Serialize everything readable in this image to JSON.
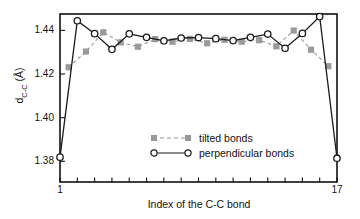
{
  "chart_data": {
    "type": "line",
    "title": "",
    "xlabel": "Index of the C-C bond",
    "ylabel_html": "d<sub>C-C</sub> (Å)",
    "ylabel_plain": "d_C-C (A)",
    "xlim": [
      1,
      17
    ],
    "ylim": [
      1.3705,
      1.4475
    ],
    "yticks": [
      1.38,
      1.4,
      1.42,
      1.44
    ],
    "ytick_labels": [
      "1.38",
      "1.40",
      "1.42",
      "1.44"
    ],
    "xticks": [
      1,
      2,
      3,
      4,
      5,
      6,
      7,
      8,
      9,
      10,
      11,
      12,
      13,
      14,
      15,
      16,
      17
    ],
    "xtick_labels_shown": [
      "1",
      "17"
    ],
    "grid": false,
    "legend_position": "center",
    "series": [
      {
        "name": "tilted bonds",
        "marker": "filled-square",
        "color": "#9a9a9a",
        "linestyle": "dashed",
        "x": [
          1.5,
          2.5,
          3.5,
          4.5,
          5.5,
          6.5,
          7.5,
          8.5,
          9.5,
          10.5,
          11.5,
          12.5,
          13.5,
          14.5,
          15.5,
          16.5
        ],
        "values": [
          1.4231,
          1.4303,
          1.4391,
          1.4345,
          1.4325,
          1.436,
          1.4348,
          1.4361,
          1.4341,
          1.4357,
          1.4348,
          1.4355,
          1.4327,
          1.4399,
          1.4311,
          1.4236
        ]
      },
      {
        "name": "perpendicular bonds",
        "marker": "open-circle",
        "color": "#1a1a1a",
        "linestyle": "solid",
        "x": [
          1,
          2,
          3,
          4,
          5,
          6,
          7,
          8,
          9,
          10,
          11,
          12,
          13,
          14,
          15,
          16,
          17
        ],
        "values": [
          1.3819,
          1.4444,
          1.4385,
          1.4313,
          1.4384,
          1.4368,
          1.4352,
          1.4365,
          1.4367,
          1.4362,
          1.4353,
          1.4368,
          1.4383,
          1.4318,
          1.4386,
          1.4463,
          1.3814
        ]
      }
    ]
  },
  "legend": {
    "items": [
      {
        "label": "tilted bonds"
      },
      {
        "label": "perpendicular bonds"
      }
    ]
  },
  "axis": {
    "x_label": "Index of the C-C bond",
    "x_first": "1",
    "x_last": "17"
  }
}
